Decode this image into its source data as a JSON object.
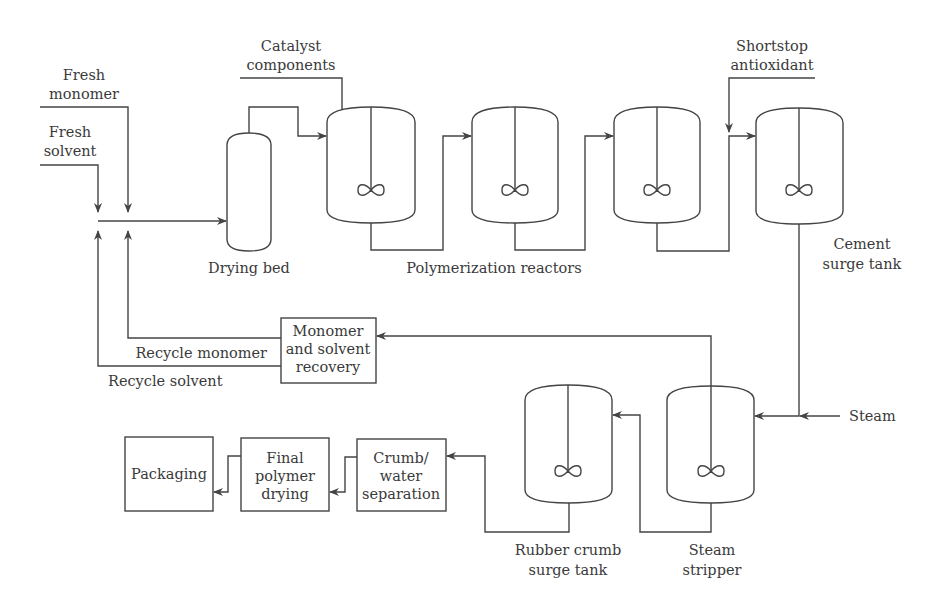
{
  "diagram": {
    "type": "process-flow",
    "inputs": {
      "fresh_monomer": [
        "Fresh",
        "monomer"
      ],
      "fresh_solvent": [
        "Fresh",
        "solvent"
      ],
      "catalyst": [
        "Catalyst",
        "components"
      ],
      "shortstop": [
        "Shortstop",
        "antioxidant"
      ],
      "steam": "Steam"
    },
    "units": {
      "drying_bed": "Drying bed",
      "reactors": "Polymerization reactors",
      "cement_tank": [
        "Cement",
        "surge tank"
      ],
      "recovery": [
        "Monomer",
        "and solvent",
        "recovery"
      ],
      "steam_stripper": [
        "Steam",
        "stripper"
      ],
      "crumb_tank": [
        "Rubber crumb",
        "surge tank"
      ],
      "crumb_water": [
        "Crumb/",
        "water",
        "separation"
      ],
      "final_drying": [
        "Final",
        "polymer",
        "drying"
      ],
      "packaging": "Packaging"
    },
    "streams": {
      "recycle_monomer": "Recycle monomer",
      "recycle_solvent": "Recycle solvent"
    },
    "colors": {
      "line": "#444444",
      "text": "#3a3a3a",
      "background": "#ffffff"
    }
  }
}
